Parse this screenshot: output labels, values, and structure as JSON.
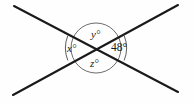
{
  "figure": {
    "kind": "intersecting-lines-angle-diagram",
    "background_color": "#fefefe",
    "stroke_color": "#1a1a1a",
    "circle_stroke_color": "#4a4a4a",
    "text_color": "#1a1a1a",
    "intersection": {
      "x": 96,
      "y": 48
    },
    "circle": {
      "cx": 96,
      "cy": 48,
      "r": 25
    },
    "outer_arc_right": {
      "cx": 96,
      "cy": 48,
      "r": 34
    },
    "outer_arc_left": {
      "cx": 96,
      "cy": 48,
      "r": 34
    },
    "lines": [
      {
        "name": "line-down-right",
        "x1": 14,
        "y1": 6,
        "x2": 178,
        "y2": 92
      },
      {
        "name": "line-up-right",
        "x1": 13,
        "y1": 95,
        "x2": 178,
        "y2": 5
      }
    ],
    "labels": {
      "left": {
        "symbol": "x",
        "degree": "°",
        "text": "x°"
      },
      "top": {
        "symbol": "y",
        "degree": "°",
        "text": "y°"
      },
      "bottom": {
        "symbol": "z",
        "degree": "°",
        "text": "z°"
      },
      "right": {
        "symbol": "48",
        "degree": "°",
        "text": "48°"
      }
    }
  }
}
